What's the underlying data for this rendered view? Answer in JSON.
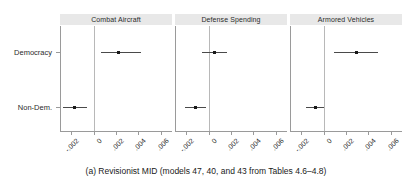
{
  "figure": {
    "caption": "(a) Revisionist MID (models 47, 40, and 43 from Tables 4.6–4.8)",
    "y_categories": [
      "Democracy",
      "Non-Dem."
    ],
    "colors": {
      "strip_background": "#e8e8e8",
      "axis": "#9a9a9a",
      "zero_line": "#b8b8b8",
      "interval": "#4a4a4a",
      "point": "#1a1a1a",
      "text": "#1a1a1a",
      "background": "#ffffff"
    }
  },
  "chart_data": {
    "type": "scatter",
    "title": "",
    "subtitle": "",
    "xlabel": "",
    "ylabel": "",
    "grid": false,
    "legend": "none",
    "orientation": "horizontal",
    "panels": [
      {
        "name": "Combat Aircraft",
        "xlim": [
          -0.003,
          0.007
        ],
        "xticks": [
          -0.002,
          0,
          0.002,
          0.004,
          0.006
        ],
        "xticklabels": [
          "-.002",
          "0",
          ".002",
          ".004",
          ".006"
        ],
        "zero_reference": 0,
        "points": [
          {
            "category": "Democracy",
            "estimate": 0.00225,
            "ci_low": 0.0007,
            "ci_high": 0.0042
          },
          {
            "category": "Non-Dem.",
            "estimate": -0.0017,
            "ci_low": -0.0027,
            "ci_high": -0.00055
          }
        ]
      },
      {
        "name": "Defense Spending",
        "xlim": [
          -0.003,
          0.007
        ],
        "xticks": [
          -0.002,
          0,
          0.002,
          0.004,
          0.006
        ],
        "xticklabels": [
          "-.002",
          "0",
          ".002",
          ".004",
          ".006"
        ],
        "zero_reference": 0,
        "points": [
          {
            "category": "Democracy",
            "estimate": 0.00055,
            "ci_low": -0.00055,
            "ci_high": 0.0016
          },
          {
            "category": "Non-Dem.",
            "estimate": -0.0012,
            "ci_low": -0.0021,
            "ci_high": -0.00025
          }
        ]
      },
      {
        "name": "Armored Vehicles",
        "xlim": [
          -0.003,
          0.007
        ],
        "xticks": [
          -0.002,
          0,
          0.002,
          0.004,
          0.006
        ],
        "xticklabels": [
          "-.002",
          "0",
          ".002",
          ".004",
          ".006"
        ],
        "zero_reference": 0,
        "points": [
          {
            "category": "Democracy",
            "estimate": 0.0029,
            "ci_low": 0.0009,
            "ci_high": 0.0049
          },
          {
            "category": "Non-Dem.",
            "estimate": -0.00075,
            "ci_low": -0.0016,
            "ci_high": 5e-05
          }
        ]
      }
    ]
  }
}
